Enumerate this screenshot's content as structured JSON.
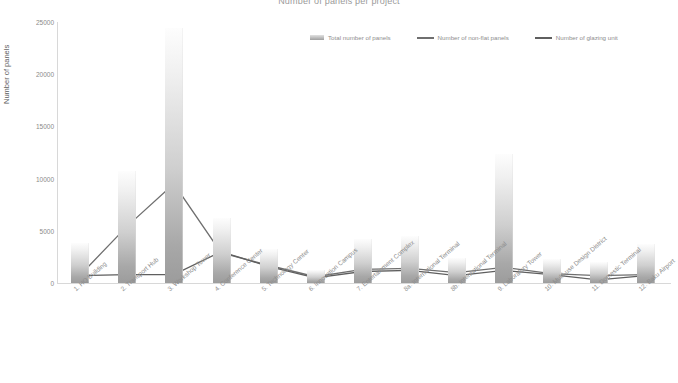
{
  "chart_data": {
    "type": "bar",
    "title": "Number of panels per project",
    "xlabel": "",
    "ylabel": "Number of panels",
    "ylim": [
      0,
      25000
    ],
    "yticks": [
      0,
      5000,
      10000,
      15000,
      20000,
      25000
    ],
    "ytick_labels": [
      "0",
      "5000",
      "10000",
      "15000",
      "20000",
      "25000"
    ],
    "grid": false,
    "legend_position": "top-right",
    "categories": [
      "1. HQ Building",
      "2. Transport Hub",
      "3. Workshop Tower",
      "4. Conference Center",
      "5. Technology Center",
      "6. Innovation Campus",
      "7. Entertainment Complex",
      "8a. International Terminal",
      "8b. International Terminal",
      "9. Laboratory Tower",
      "10. Multi-use Design District",
      "11. Domestic Terminal",
      "12. Baku Airport"
    ],
    "series": [
      {
        "name": "Total number of panels",
        "type": "bar",
        "values": [
          3800,
          10700,
          24400,
          6200,
          3300,
          1200,
          4200,
          4500,
          2400,
          12400,
          2300,
          2000,
          3700
        ]
      },
      {
        "name": "Number of non-flat panels",
        "type": "line",
        "values": [
          700,
          5400,
          9500,
          2900,
          1700,
          600,
          1300,
          1400,
          1000,
          1500,
          900,
          700,
          800
        ]
      },
      {
        "name": "Number of glazing unit",
        "type": "line",
        "values": [
          700,
          800,
          800,
          3000,
          1600,
          500,
          1100,
          1200,
          700,
          1200,
          800,
          300,
          700
        ]
      }
    ]
  },
  "legend": {
    "items": [
      {
        "label": "Total number of panels",
        "marker": "bar-swatch",
        "color": "#b4b4b4"
      },
      {
        "label": "Number of non-flat panels",
        "marker": "line-swatch",
        "color": "#6f6f6f"
      },
      {
        "label": "Number of glazing unit",
        "marker": "line-swatch",
        "color": "#5f5f5f"
      }
    ]
  },
  "colors": {
    "bar_top": "#fdfdfd",
    "bar_bottom": "#9c9c9c",
    "line_non_flat": "#6f6f6f",
    "line_glazing": "#5f5f5f",
    "axis": "#d8d8d8",
    "text": "#8a8a8a"
  }
}
